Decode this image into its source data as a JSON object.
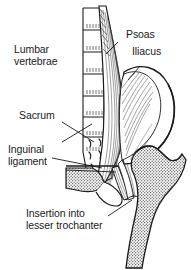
{
  "figure": {
    "background_color": "#ffffff",
    "ink_color": "#1a1a1a",
    "width": 191,
    "height": 270
  },
  "labels": {
    "lumbar_vertebrae": "Lumbar\nvertebrae",
    "psoas": "Psoas",
    "iliacus": "Iliacus",
    "sacrum": "Sacrum",
    "inguinal_ligament": "Inguinal\nligament",
    "insertion": "Insertion into\nlesser trochanter"
  },
  "structures": [
    {
      "name": "lumbar-vertebrae",
      "label": "Lumbar vertebrae"
    },
    {
      "name": "psoas-muscle",
      "label": "Psoas"
    },
    {
      "name": "iliacus-muscle",
      "label": "Iliacus"
    },
    {
      "name": "sacrum",
      "label": "Sacrum"
    },
    {
      "name": "inguinal-ligament",
      "label": "Inguinal ligament"
    },
    {
      "name": "lesser-trochanter",
      "label": "Insertion into lesser trochanter"
    },
    {
      "name": "femur",
      "label": "Femur"
    },
    {
      "name": "ilium",
      "label": "Ilium"
    }
  ]
}
